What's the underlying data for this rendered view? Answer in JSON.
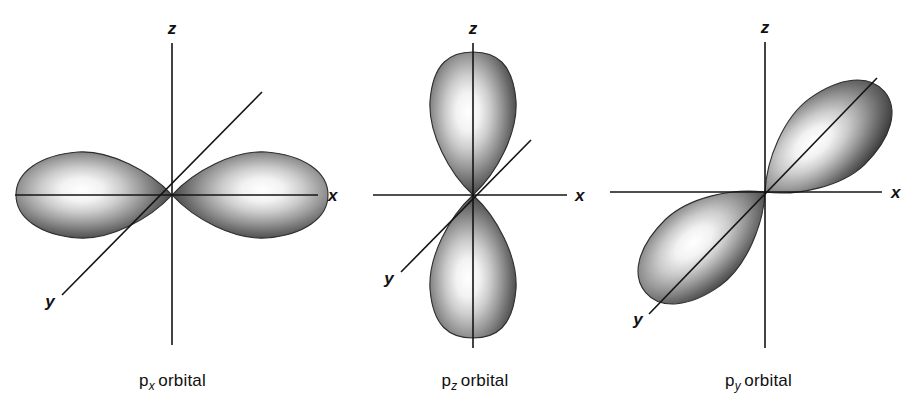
{
  "figure": {
    "background_color": "#ffffff",
    "ink_color": "#111111",
    "panel_count": 3
  },
  "panels": [
    {
      "id": "px",
      "caption_symbol": "p",
      "caption_subscript": "x",
      "caption_word": "orbital",
      "caption_full": "p_x orbital",
      "orbital_type": "p",
      "lobe_axis": "x",
      "lobe_count": 2,
      "axes": [
        {
          "label": "z",
          "orientation": "vertical",
          "label_position": "top"
        },
        {
          "label": "x",
          "orientation": "horizontal",
          "label_position": "right"
        },
        {
          "label": "y",
          "orientation": "diagonal",
          "label_position": "bottom-left"
        }
      ]
    },
    {
      "id": "pz",
      "caption_symbol": "p",
      "caption_subscript": "z",
      "caption_word": "orbital",
      "caption_full": "p_z orbital",
      "orbital_type": "p",
      "lobe_axis": "z",
      "lobe_count": 2,
      "axes": [
        {
          "label": "z",
          "orientation": "vertical",
          "label_position": "top"
        },
        {
          "label": "x",
          "orientation": "horizontal",
          "label_position": "right"
        },
        {
          "label": "y",
          "orientation": "diagonal",
          "label_position": "bottom-left"
        }
      ]
    },
    {
      "id": "py",
      "caption_symbol": "p",
      "caption_subscript": "y",
      "caption_word": "orbital",
      "caption_full": "p_y orbital",
      "orbital_type": "p",
      "lobe_axis": "y",
      "lobe_count": 2,
      "axes": [
        {
          "label": "z",
          "orientation": "vertical",
          "label_position": "top"
        },
        {
          "label": "x",
          "orientation": "horizontal",
          "label_position": "right"
        },
        {
          "label": "y",
          "orientation": "diagonal",
          "label_position": "bottom-left"
        }
      ]
    }
  ]
}
